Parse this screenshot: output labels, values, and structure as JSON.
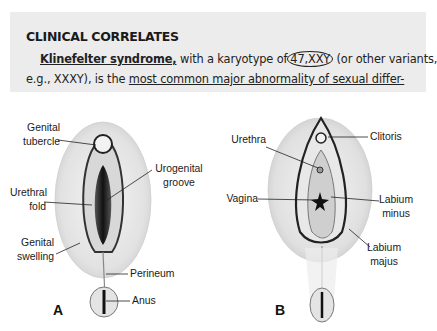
{
  "clinical_box": {
    "title": "CLINICAL CORRELATES",
    "line1": {
      "term": "Klinefelter syndrome,",
      "mid": " with a karyotype of",
      "karyotype": "47,XXY",
      "end": " (or other variants,"
    },
    "line2": {
      "start": "e.g., XXXY), is the ",
      "underlined": "most common major abnormality of sexual differ-"
    }
  },
  "figure": {
    "panel_a": {
      "letter": "A",
      "labels": {
        "genital_tubercle": "Genital\ntubercle",
        "urethral_fold": "Urethral\nfold",
        "urogenital_groove": "Urogenital\ngroove",
        "genital_swelling": "Genital\nswelling",
        "perineum": "Perineum",
        "anus": "Anus"
      }
    },
    "panel_b": {
      "letter": "B",
      "labels": {
        "clitoris": "Clitoris",
        "urethra": "Urethra",
        "vagina": "Vagina",
        "labium_minus": "Labium\nminus",
        "labium_majus": "Labium\nmajus"
      }
    }
  }
}
